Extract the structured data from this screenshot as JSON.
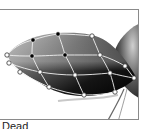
{
  "preview": {
    "title": "Mesh warp preview",
    "caption": "Dead",
    "frame_color": "#8a8a8a",
    "shape_fill_dark": "#0a0a0a",
    "shape_fill_light": "#9a9a9a",
    "mesh_line_color": "#f0f0f0",
    "mesh_nodes": {
      "selected_color": "#000000",
      "unselected_color": "#ffffff",
      "selected": [
        {
          "x": 33,
          "y": 39
        },
        {
          "x": 58,
          "y": 33
        },
        {
          "x": 32,
          "y": 55
        },
        {
          "x": 65,
          "y": 54
        }
      ],
      "unselected": [
        {
          "x": 7,
          "y": 54
        },
        {
          "x": 9,
          "y": 62
        },
        {
          "x": 20,
          "y": 71
        },
        {
          "x": 92,
          "y": 35
        },
        {
          "x": 100,
          "y": 54
        },
        {
          "x": 125,
          "y": 65
        },
        {
          "x": 40,
          "y": 71
        },
        {
          "x": 75,
          "y": 74
        },
        {
          "x": 110,
          "y": 72
        },
        {
          "x": 134,
          "y": 77
        },
        {
          "x": 49,
          "y": 86
        },
        {
          "x": 84,
          "y": 94
        },
        {
          "x": 115,
          "y": 91
        }
      ]
    }
  }
}
